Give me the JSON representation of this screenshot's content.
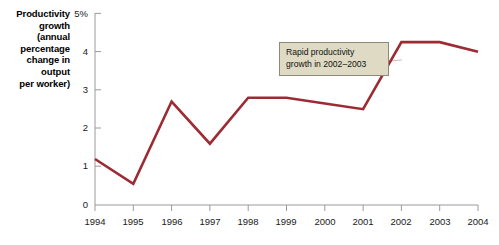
{
  "chart_data": {
    "type": "line",
    "title": "",
    "subtitle": "",
    "ylabel": "Productivity growth (annual percentage change in output per worker)",
    "xlabel": "",
    "categories": [
      "1994",
      "1995",
      "1996",
      "1997",
      "1998",
      "1999",
      "2000",
      "2001",
      "2002",
      "2003",
      "2004"
    ],
    "x": [
      1994,
      1995,
      1996,
      1997,
      1998,
      1999,
      2000,
      2001,
      2002,
      2003,
      2004
    ],
    "series": [
      {
        "name": "Productivity growth",
        "values": [
          1.2,
          0.55,
          2.7,
          1.6,
          2.8,
          2.8,
          2.65,
          2.5,
          4.25,
          4.25,
          4.0
        ],
        "color": "#9d2b33"
      }
    ],
    "ylim": [
      0,
      5
    ],
    "ytick_values": [
      0,
      1,
      2,
      3,
      4,
      5
    ],
    "ytick_labels": [
      "0",
      "1",
      "2",
      "3",
      "4",
      "5%"
    ],
    "xlim": [
      1994,
      2004
    ],
    "grid": false,
    "legend": false,
    "legend_position": "none",
    "annotations": [
      {
        "text_lines": [
          "Rapid productivity",
          "growth in 2002–2003"
        ],
        "target_series": "Productivity growth",
        "target_x": 2002,
        "background": "#dedac4",
        "border_color": "#8d8a76"
      }
    ]
  },
  "axis": {
    "y_title_lines": [
      "Productivity",
      "growth",
      "(annual",
      "percentage",
      "change in",
      "output",
      "per worker)"
    ],
    "y_title_text": "Productivity growth (annual percentage change in output per worker)",
    "ytick_labels": [
      "5%",
      "4",
      "3",
      "2",
      "1",
      "0"
    ],
    "xtick_labels": [
      "1994",
      "1995",
      "1996",
      "1997",
      "1998",
      "1999",
      "2000",
      "2001",
      "2002",
      "2003",
      "2004"
    ],
    "axis_color": "#9a9a9a"
  },
  "annotation": {
    "line1": "Rapid productivity",
    "line2": "growth in 2002–2003"
  },
  "colors": {
    "line": "#9d2b33",
    "axis": "#9a9a9a",
    "annotation_bg": "#dedac4",
    "annotation_border": "#8d8a76",
    "connector": "#d9b8bb",
    "background": "#ffffff",
    "text": "#111111"
  }
}
